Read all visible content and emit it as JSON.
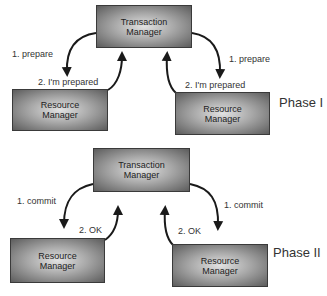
{
  "diagram": {
    "phase1": {
      "label": "Phase I",
      "transaction_manager": {
        "line1": "Transaction",
        "line2": "Manager"
      },
      "resource_manager_left": {
        "line1": "Resource",
        "line2": "Manager"
      },
      "resource_manager_right": {
        "line1": "Resource",
        "line2": "Manager"
      },
      "request_left": "1. prepare",
      "request_right": "1. prepare",
      "reply_left": "2. I'm prepared",
      "reply_right": "2. I'm prepared"
    },
    "phase2": {
      "label": "Phase II",
      "transaction_manager": {
        "line1": "Transaction",
        "line2": "Manager"
      },
      "resource_manager_left": {
        "line1": "Resource",
        "line2": "Manager"
      },
      "resource_manager_right": {
        "line1": "Resource",
        "line2": "Manager"
      },
      "request_left": "1. commit",
      "request_right": "1. commit",
      "reply_left": "2. OK",
      "reply_right": "2. OK"
    },
    "colors": {
      "box_border": "#3a3a3a",
      "box_center": "#e2e2e2",
      "box_edge": "#5c5c5c",
      "arrow": "#1a1a1a",
      "text": "#333333"
    }
  }
}
